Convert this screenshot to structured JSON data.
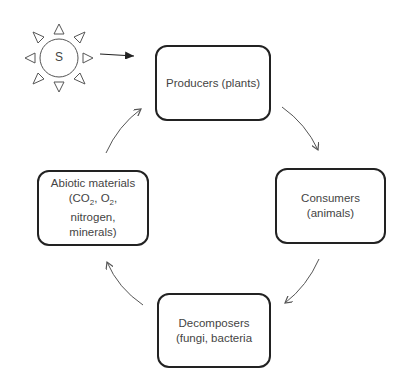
{
  "sun": {
    "label": "S"
  },
  "nodes": {
    "producers": {
      "line1": "Producers (plants)"
    },
    "consumers": {
      "line1": "Consumers",
      "line2": "(animals)"
    },
    "decomposers": {
      "line1": "Decomposers",
      "line2": "(fungi, bacteria"
    },
    "abiotic": {
      "line1": "Abiotic materials",
      "line2_prefix": "(CO",
      "line2_sub1": "2",
      "line2_mid": ", O",
      "line2_sub2": "2",
      "line2_suffix": ",",
      "line3": "nitrogen,",
      "line4": "minerals)"
    }
  },
  "colors": {
    "stroke": "#222222",
    "text": "#444444",
    "arrow": "#555555"
  }
}
